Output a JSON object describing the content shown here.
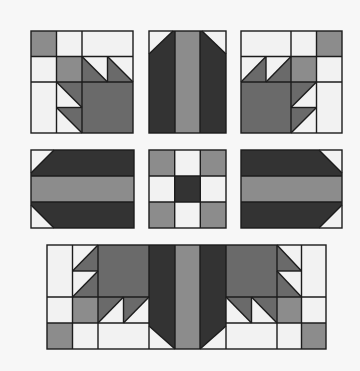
{
  "diagram": {
    "colors": {
      "background": "#f7f7f7",
      "light": "#f2f2f2",
      "medium": "#8c8c8c",
      "mid_dark": "#6a6a6a",
      "dark": "#333333",
      "outline": "#1c1c1c"
    },
    "rows": [
      {
        "name": "top-row",
        "blocks": [
          "bear-paw-corner-left",
          "center-bar-vertical-top",
          "bear-paw-corner-right"
        ]
      },
      {
        "name": "middle-row",
        "blocks": [
          "center-bar-horizontal-left",
          "nine-patch-center",
          "center-bar-horizontal-right"
        ]
      },
      {
        "name": "bottom-row",
        "blocks": [
          "bottom-assembled-strip"
        ]
      }
    ]
  }
}
